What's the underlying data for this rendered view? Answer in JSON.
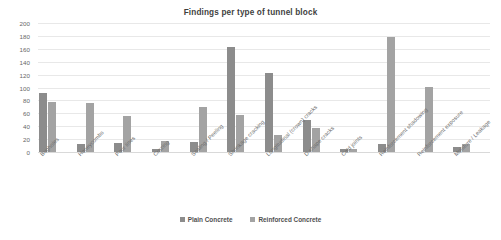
{
  "chart_data": {
    "type": "bar",
    "title": "Findings per type of tunnel block",
    "xlabel": "",
    "ylabel": "",
    "ylim": [
      0,
      200
    ],
    "ytick_step": 20,
    "yticks": [
      200,
      180,
      160,
      140,
      120,
      100,
      80,
      60,
      40,
      20,
      0
    ],
    "grid": true,
    "legend_position": "bottom",
    "categories": [
      "Bugholes",
      "Honeycombs",
      "Pour lines",
      "Crazing",
      "Scaling / Peeling",
      "Shrinkage cracking",
      "Longitudinal (crown) cracks",
      "D-shape cracks",
      "Cold joints",
      "Reinforcement shadowing",
      "Reinforcement exposure",
      "Moisture / Leakage"
    ],
    "series": [
      {
        "name": "Plain Concrete",
        "color": "#8c8c8c",
        "values": [
          92,
          13,
          14,
          4,
          15,
          163,
          122,
          50,
          5,
          13,
          0,
          8
        ]
      },
      {
        "name": "Reinforced Concrete",
        "color": "#a3a3a3",
        "values": [
          78,
          76,
          56,
          17,
          70,
          58,
          27,
          38,
          5,
          178,
          101,
          13
        ]
      }
    ]
  },
  "legend": {
    "items": [
      {
        "label": "Plain Concrete",
        "color": "#8c8c8c"
      },
      {
        "label": "Reinforced Concrete",
        "color": "#a3a3a3"
      }
    ]
  }
}
